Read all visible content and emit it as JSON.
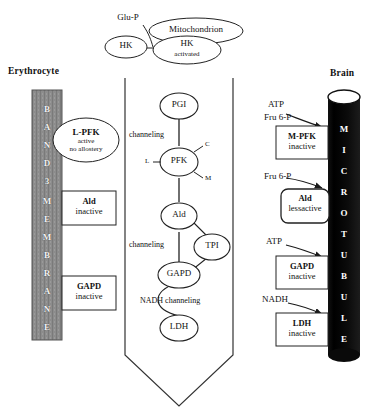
{
  "diagram": {
    "title_hidden": "Compartmentation of glycolytic enzymes in erythrocyte and brain",
    "panels": {
      "left": {
        "label": "Erythrocyte"
      },
      "right": {
        "label": "Brain"
      }
    },
    "colors": {
      "band3_fill": "#8c8c8c",
      "microtubule_fill": "#0a0a0a",
      "stroke": "#222222",
      "page_bg": "#ffffff",
      "white_text": "#ffffff"
    }
  },
  "top_section": {
    "substrate": "Glu-P",
    "hk_free": "HK",
    "mitochondrion": "Mitochondrion",
    "hk_activated_line1": "HK",
    "hk_activated_line2": "activated"
  },
  "left_panel": {
    "label": "Erythrocyte",
    "band_letters": [
      "B",
      "A",
      "N",
      "D",
      "3",
      "M",
      "E",
      "M",
      "B",
      "R",
      "A",
      "N",
      "E"
    ],
    "band_text": "BAND 3 MEMBRANE",
    "enzyme_ellipse": {
      "name": "L-PFK",
      "state_line1": "active",
      "state_line2": "no allostery"
    },
    "boxes": [
      {
        "name": "Ald",
        "state": "inactive"
      },
      {
        "name": "GAPD",
        "state": "inactive"
      }
    ]
  },
  "middle_panel": {
    "shape": "funnel",
    "nodes": [
      {
        "id": "pgi",
        "label": "PGI"
      },
      {
        "id": "pfk",
        "label": "PFK"
      },
      {
        "id": "ald",
        "label": "Ald"
      },
      {
        "id": "tpi",
        "label": "TPI"
      },
      {
        "id": "gapd",
        "label": "GAPD"
      },
      {
        "id": "ldh",
        "label": "LDH"
      }
    ],
    "pfk_subunits": {
      "left": "L",
      "right_top": "C",
      "right_bottom": "M"
    },
    "annotations": [
      {
        "id": "ch1",
        "text": "channeling"
      },
      {
        "id": "ch2",
        "text": "channeling"
      },
      {
        "id": "ch3",
        "text": "NADH channeling"
      }
    ]
  },
  "right_panel": {
    "label": "Brain",
    "tubule_letters": [
      "M",
      "I",
      "C",
      "R",
      "O",
      "T",
      "U",
      "B",
      "U",
      "L",
      "E"
    ],
    "tubule_text": "MICROTUBULE",
    "entries": [
      {
        "inputs": [
          "ATP",
          "Fru 6-P"
        ],
        "box": {
          "name": "M-PFK",
          "state": "inactive",
          "rounded": false
        }
      },
      {
        "inputs": [
          "Fru 6-P"
        ],
        "box": {
          "name": "Ald",
          "state": "lessactive",
          "rounded": true
        }
      },
      {
        "inputs": [
          "ATP"
        ],
        "box": {
          "name": "GAPD",
          "state": "inactive",
          "rounded": false
        }
      },
      {
        "inputs": [
          "NADH"
        ],
        "box": {
          "name": "LDH",
          "state": "inactive",
          "rounded": false
        }
      }
    ]
  }
}
